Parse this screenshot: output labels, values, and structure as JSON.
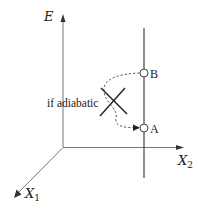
{
  "diagram": {
    "axes": {
      "vertical": {
        "label": "E"
      },
      "horizontal": {
        "label": "X",
        "subscript": "2"
      },
      "depth": {
        "label": "X",
        "subscript": "1"
      }
    },
    "points": [
      {
        "id": "B",
        "label": "B"
      },
      {
        "id": "A",
        "label": "A"
      }
    ],
    "annotation": {
      "text": "if adiabatic"
    },
    "colors": {
      "axis": "#777777",
      "line": "#444444",
      "cross": "#222222",
      "dashed": "#555555",
      "point_fill": "#ffffff"
    }
  }
}
